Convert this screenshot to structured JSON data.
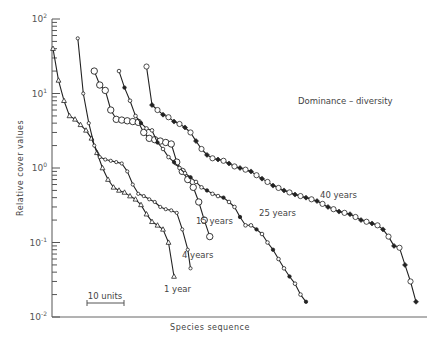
{
  "chart_data": {
    "type": "line",
    "title": "Dominance – diversity",
    "xlabel": "Species sequence",
    "ylabel": "Relative cover values",
    "yscale": "log",
    "ylim": [
      0.01,
      100
    ],
    "y_ticks": [
      {
        "base": "10",
        "exp": "2",
        "value": 100
      },
      {
        "base": "10",
        "exp": "1",
        "value": 10
      },
      {
        "base": "10",
        "exp": "0",
        "value": 1
      },
      {
        "base": "10",
        "exp": "-1",
        "value": 0.1
      },
      {
        "base": "10",
        "exp": "-2",
        "value": 0.01
      }
    ],
    "grid": false,
    "scale_bar": {
      "label": "10 units"
    },
    "series": [
      {
        "name": "1 year",
        "marker": "triangle",
        "x": [
          0,
          2,
          4,
          6,
          8,
          10,
          12,
          14,
          16,
          18,
          20,
          22,
          24,
          26,
          28,
          30,
          32,
          34,
          36,
          38,
          40,
          42,
          44
        ],
        "values": [
          40,
          15,
          8,
          5,
          4.5,
          3.8,
          3.2,
          2.5,
          1.6,
          1.0,
          0.7,
          0.55,
          0.5,
          0.47,
          0.42,
          0.38,
          0.32,
          0.24,
          0.19,
          0.17,
          0.15,
          0.1,
          0.035
        ]
      },
      {
        "name": "4 years",
        "marker": "small-circle",
        "x": [
          9,
          11,
          13,
          15,
          17,
          19,
          21,
          23,
          25,
          27,
          29,
          31,
          33,
          35,
          37,
          39,
          41,
          43,
          45,
          47,
          49,
          50
        ],
        "values": [
          55,
          10,
          4,
          2,
          1.4,
          1.3,
          1.25,
          1.2,
          1.15,
          0.9,
          0.6,
          0.45,
          0.42,
          0.38,
          0.35,
          0.3,
          0.28,
          0.27,
          0.25,
          0.15,
          0.08,
          0.045
        ]
      },
      {
        "name": "15 years",
        "marker": "large-open-circle",
        "x": [
          15,
          17,
          19,
          21,
          23,
          25,
          27,
          29,
          31,
          33,
          35,
          37,
          39,
          41,
          43,
          45,
          47,
          49,
          51,
          53,
          55,
          57
        ],
        "values": [
          20,
          13,
          11,
          6,
          4.5,
          4.4,
          4.3,
          4.2,
          4.1,
          3.0,
          2.5,
          2.4,
          2.3,
          2.2,
          2.1,
          1.2,
          0.9,
          0.7,
          0.55,
          0.35,
          0.2,
          0.12
        ]
      },
      {
        "name": "25 years",
        "marker": "small-circle-filled",
        "x": [
          24,
          26,
          28,
          30,
          32,
          34,
          36,
          38,
          40,
          42,
          44,
          46,
          48,
          50,
          52,
          54,
          56,
          58,
          60,
          62,
          64,
          66,
          68,
          70,
          72,
          74,
          76,
          78,
          80,
          82,
          84,
          86,
          88,
          90,
          92
        ],
        "values": [
          20,
          12,
          8,
          5,
          4,
          3.4,
          3.2,
          2.2,
          1.8,
          1.4,
          1.2,
          1.0,
          0.85,
          0.75,
          0.65,
          0.55,
          0.5,
          0.45,
          0.42,
          0.4,
          0.35,
          0.3,
          0.22,
          0.17,
          0.17,
          0.15,
          0.13,
          0.1,
          0.08,
          0.06,
          0.045,
          0.035,
          0.028,
          0.02,
          0.016
        ]
      },
      {
        "name": "40 years",
        "marker": "diamond-mixed",
        "x": [
          34,
          36,
          38,
          40,
          42,
          44,
          46,
          48,
          50,
          52,
          54,
          56,
          58,
          60,
          62,
          64,
          66,
          68,
          70,
          72,
          74,
          76,
          78,
          80,
          82,
          84,
          86,
          88,
          90,
          92,
          94,
          96,
          98,
          100,
          102,
          104,
          106,
          108,
          110,
          112,
          114,
          116,
          118,
          120,
          122,
          124,
          126,
          128,
          130,
          132
        ],
        "values": [
          23,
          7,
          6,
          5.2,
          4.8,
          4.2,
          3.9,
          3.5,
          3.0,
          2.3,
          1.8,
          1.5,
          1.35,
          1.3,
          1.25,
          1.15,
          1.05,
          1.0,
          0.95,
          0.9,
          0.8,
          0.72,
          0.65,
          0.58,
          0.54,
          0.5,
          0.47,
          0.44,
          0.42,
          0.4,
          0.38,
          0.36,
          0.33,
          0.3,
          0.28,
          0.26,
          0.25,
          0.24,
          0.22,
          0.2,
          0.19,
          0.18,
          0.17,
          0.15,
          0.12,
          0.09,
          0.085,
          0.05,
          0.03,
          0.016
        ]
      }
    ],
    "label_positions": {
      "1 year": [
        164,
        292
      ],
      "4 years": [
        182,
        258
      ],
      "15 years": [
        196,
        224
      ],
      "25 years": [
        259,
        216
      ],
      "40 years": [
        320,
        198
      ]
    }
  },
  "axes": {
    "y_label": "Relative cover values",
    "x_label": "Species sequence"
  },
  "annotation": "Dominance – diversity",
  "scale_bar_label": "10 units"
}
